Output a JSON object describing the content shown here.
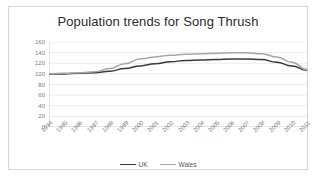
{
  "chart_data": {
    "type": "line",
    "title": "Population trends for Song Thrush",
    "xlabel": "",
    "ylabel": "",
    "x": [
      1994,
      1995,
      1996,
      1997,
      1998,
      1999,
      2000,
      2001,
      2002,
      2003,
      2004,
      2005,
      2006,
      2007,
      2008,
      2009,
      2010,
      2011
    ],
    "categories": [
      "1994",
      "1995",
      "1996",
      "1997",
      "1998",
      "1999",
      "2000",
      "2001",
      "2002",
      "2003",
      "2004",
      "2005",
      "2006",
      "2007",
      "2008",
      "2009",
      "2010",
      "2011"
    ],
    "ylim": [
      0,
      160
    ],
    "yticks": [
      0,
      20,
      40,
      60,
      80,
      100,
      120,
      140,
      160
    ],
    "ytick_labels": [
      "0",
      "20",
      "40",
      "60",
      "80",
      "100",
      "120",
      "140",
      "160"
    ],
    "grid": "horizontal",
    "legend_position": "bottom",
    "series": [
      {
        "name": "UK",
        "color": "#3a3a3a",
        "values": [
          100,
          100,
          101,
          102,
          105,
          110,
          115,
          119,
          123,
          125,
          126,
          127,
          128,
          128,
          127,
          122,
          115,
          107
        ]
      },
      {
        "name": "Wales",
        "color": "#a6a6a6",
        "values": [
          100,
          101,
          102,
          104,
          110,
          119,
          128,
          132,
          135,
          137,
          138,
          139,
          140,
          140,
          138,
          132,
          122,
          108
        ]
      }
    ]
  },
  "legend": {
    "entries": [
      {
        "label": "UK",
        "color": "#3a3a3a"
      },
      {
        "label": "Wales",
        "color": "#a6a6a6"
      }
    ]
  },
  "colors": {
    "frame_border": "#d4d4d4",
    "gridline": "#e2e2e2",
    "axis": "#bfbfbf",
    "tick_text": "#7a7a7a",
    "title_text": "#2b2b2b",
    "background": "#ffffff"
  }
}
